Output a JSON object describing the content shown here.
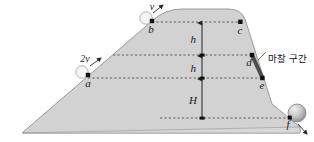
{
  "figure": {
    "type": "physics-incline-diagram",
    "colors": {
      "hill_fill": "#d2d2d2",
      "hill_stroke": "#9a9a9a",
      "dashed": "#555555",
      "point": "#111111",
      "friction_segment": "#4a4a4a",
      "ball": "#bdbdbd",
      "ball_stroke": "#8a8a8a",
      "text": "#1a1a1a",
      "background": "#ffffff"
    },
    "points": [
      {
        "id": "a",
        "label": "a",
        "x": 88,
        "y": 75
      },
      {
        "id": "b",
        "label": "b",
        "x": 152,
        "y": 21
      },
      {
        "id": "c",
        "label": "c",
        "x": 240,
        "y": 22
      },
      {
        "id": "d",
        "label": "d",
        "x": 252,
        "y": 55
      },
      {
        "id": "e",
        "label": "e",
        "x": 262,
        "y": 78
      },
      {
        "id": "f",
        "label": "f",
        "x": 290,
        "y": 118
      }
    ],
    "dimensions": [
      {
        "id": "h-top",
        "label": "h",
        "from_y": 22,
        "to_y": 55
      },
      {
        "id": "h-middle",
        "label": "h",
        "from_y": 55,
        "to_y": 78
      },
      {
        "id": "H-bottom",
        "label": "H",
        "from_y": 78,
        "to_y": 118
      }
    ],
    "velocities": [
      {
        "id": "v-at-b",
        "label": "v",
        "at_point": "b"
      },
      {
        "id": "v-at-a",
        "label": "2v",
        "at_point": "a"
      }
    ],
    "annotations": [
      {
        "id": "friction-zone",
        "label": "마찰 구간",
        "between": "d-e"
      }
    ],
    "dashed_levels": [
      {
        "id": "level-bc",
        "y": 22,
        "x1": 152,
        "x2": 240
      },
      {
        "id": "level-d",
        "y": 55,
        "x1": 113,
        "x2": 252
      },
      {
        "id": "level-ae",
        "y": 78,
        "x1": 88,
        "x2": 262
      },
      {
        "id": "level-f",
        "y": 118,
        "x1": 160,
        "x2": 292
      }
    ]
  }
}
